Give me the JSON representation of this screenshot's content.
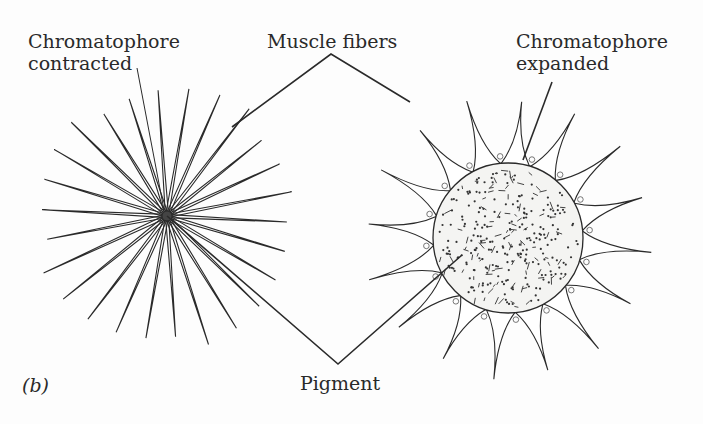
{
  "figure": {
    "panel_label": "(b)",
    "labels": {
      "chromatophore_contracted_line1": "Chromatophore",
      "chromatophore_contracted_line2": "contracted",
      "muscle_fibers": "Muscle fibers",
      "chromatophore_expanded_line1": "Chromatophore",
      "chromatophore_expanded_line2": "expanded",
      "pigment": "Pigment"
    },
    "colors": {
      "ink": "#2a2a2a",
      "pigment_fill": "#f4f4f2",
      "background": "#fdfdfd"
    }
  }
}
